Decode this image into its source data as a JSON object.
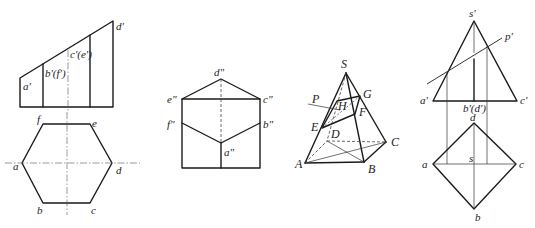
{
  "figure1": {
    "front_view": {
      "labels": {
        "a": "a'",
        "bf": "b'(f')",
        "ce": "c'(e')",
        "d": "d'"
      }
    },
    "top_view": {
      "labels": {
        "a": "a",
        "b": "b",
        "c": "c",
        "d": "d",
        "e": "e",
        "f": "f"
      }
    }
  },
  "figure2": {
    "side_view": {
      "labels": {
        "a": "a\"",
        "b": "b\"",
        "c": "c\"",
        "d": "d\"",
        "e": "e\"",
        "f": "f\""
      }
    }
  },
  "figure3": {
    "pyramid": {
      "labels": {
        "S": "S",
        "A": "A",
        "B": "B",
        "C": "C",
        "D": "D",
        "E": "E",
        "F": "F",
        "G": "G",
        "H": "H",
        "P": "P"
      }
    }
  },
  "figure4": {
    "front_view": {
      "labels": {
        "s": "s'",
        "p": "p'",
        "a": "a'",
        "bd": "b'(d')",
        "c": "c'"
      }
    },
    "top_view": {
      "labels": {
        "a": "a",
        "b": "b",
        "c": "c",
        "d": "d",
        "s": "s"
      }
    }
  }
}
